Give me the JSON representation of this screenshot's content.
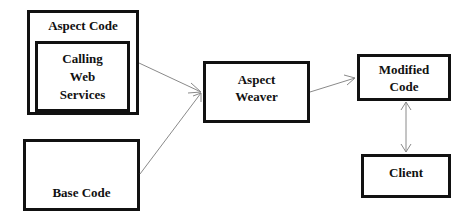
{
  "diagram": {
    "nodes": {
      "aspect_code": {
        "label": "Aspect Code"
      },
      "calling_web_services": {
        "label": "Calling\nWeb\nServices"
      },
      "base_code": {
        "label": "Base Code"
      },
      "aspect_weaver": {
        "label": "Aspect\nWeaver"
      },
      "modified_code": {
        "label": "Modified\nCode"
      },
      "client": {
        "label": "Client"
      }
    },
    "edges": [
      {
        "from": "aspect_code",
        "to": "aspect_weaver",
        "type": "arrow"
      },
      {
        "from": "base_code",
        "to": "aspect_weaver",
        "type": "arrow"
      },
      {
        "from": "aspect_weaver",
        "to": "modified_code",
        "type": "arrow"
      },
      {
        "from": "modified_code",
        "to": "client",
        "type": "bidirectional"
      }
    ],
    "colors": {
      "border": "#111111",
      "arrow": "#8a8a8a",
      "background": "#ffffff"
    }
  }
}
